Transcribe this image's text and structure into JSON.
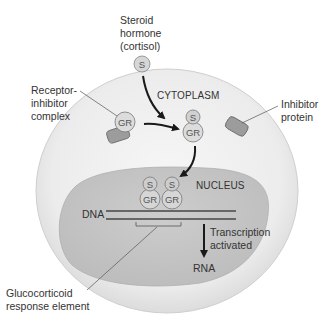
{
  "diagram": {
    "compartments": {
      "cytoplasm": "CYTOPLASM",
      "nucleus": "NUCLEUS"
    },
    "labels": {
      "hormone_line1": "Steroid",
      "hormone_line2": "hormone",
      "hormone_line3": "(cortisol)",
      "receptor_line1": "Receptor-",
      "receptor_line2": "inhibitor",
      "receptor_line3": "complex",
      "inhibitor_line1": "Inhibitor",
      "inhibitor_line2": "protein",
      "dna": "DNA",
      "transcription_line1": "Transcription",
      "transcription_line2": "activated",
      "rna": "RNA",
      "gre_line1": "Glucocorticoid",
      "gre_line2": "response element"
    },
    "molecules": {
      "steroid": "S",
      "receptor": "GR"
    },
    "colors": {
      "cell_fill": "#e6e6e6",
      "cell_inner": "#f3f3f3",
      "nucleus_fill": "#c4c4c4",
      "molecule_fill": "#d9d9d9",
      "inhibitor_fill": "#9a9a9a",
      "dna": "#666666",
      "arrow": "#1a1a1a"
    }
  }
}
